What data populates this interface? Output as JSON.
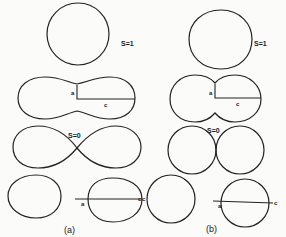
{
  "figure": {
    "panels": [
      {
        "id": "a",
        "label": "(a)",
        "shapes": [
          {
            "name": "sphere",
            "s_label": "S=1"
          },
          {
            "name": "peanut",
            "a_label": "a",
            "c_label": "c"
          },
          {
            "name": "lemniscate",
            "s_label": "S=0"
          },
          {
            "name": "split-pair",
            "a_label": "a",
            "c_label": "c"
          }
        ]
      },
      {
        "id": "b",
        "label": "(b)",
        "shapes": [
          {
            "name": "sphere",
            "s_label": "S=1"
          },
          {
            "name": "dumbbell",
            "a_label": "a",
            "c_label": "c"
          },
          {
            "name": "touching-spheres",
            "s_label": "S=0"
          },
          {
            "name": "separate-spheres",
            "a_label": "a",
            "c_label": "c",
            "extra_c_label": "c"
          }
        ]
      }
    ],
    "colors": {
      "stroke": "#222222",
      "background": "#fbfbfa"
    }
  }
}
